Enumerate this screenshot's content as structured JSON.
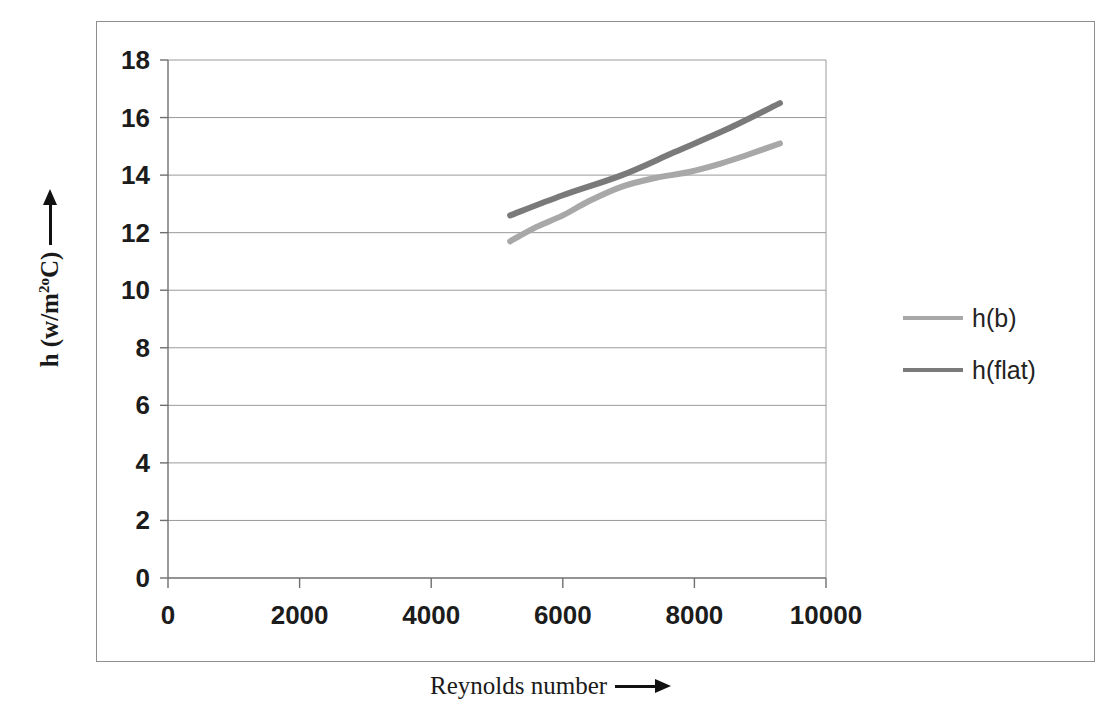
{
  "chart_data": {
    "type": "line",
    "title": "",
    "xlabel": "Reynolds number",
    "ylabel": "h (w/m2oC)",
    "ylabel_parts": {
      "prefix": "h  (w/m",
      "superscript": "2o",
      "suffix": "C)"
    },
    "xlim": [
      0,
      10000
    ],
    "ylim": [
      0,
      18
    ],
    "xticks": [
      0,
      2000,
      4000,
      6000,
      8000,
      10000
    ],
    "yticks": [
      0,
      2,
      4,
      6,
      8,
      10,
      12,
      14,
      16,
      18
    ],
    "xtick_labels": [
      "0",
      "2000",
      "4000",
      "6000",
      "8000",
      "10000"
    ],
    "ytick_labels": [
      "0",
      "2",
      "4",
      "6",
      "8",
      "10",
      "12",
      "14",
      "16",
      "18"
    ],
    "grid": "horizontal",
    "legend_position": "right",
    "series": [
      {
        "name": "h(b)",
        "color": "#a8a8a8",
        "x": [
          5200,
          5600,
          6000,
          6400,
          6900,
          7400,
          7900,
          8400,
          8800,
          9300
        ],
        "y": [
          11.7,
          12.2,
          12.6,
          13.1,
          13.6,
          13.9,
          14.1,
          14.4,
          14.7,
          15.1
        ]
      },
      {
        "name": "h(flat)",
        "color": "#7a7a7a",
        "x": [
          5200,
          6000,
          6900,
          7700,
          8500,
          9300
        ],
        "y": [
          12.6,
          13.3,
          14.0,
          14.8,
          15.6,
          16.5
        ]
      }
    ]
  },
  "legend": {
    "entries": [
      {
        "label": "h(b)",
        "color": "#a8a8a8"
      },
      {
        "label": "h(flat)",
        "color": "#7a7a7a"
      }
    ]
  },
  "axes": {
    "x_title": "Reynolds number",
    "y_title_prefix": "h  (w/m",
    "y_title_sup": "2o",
    "y_title_suffix": "C)"
  },
  "colors": {
    "frame": "#8d8d8d",
    "axis": "#6f6f6f",
    "gridline": "#9a9a9a",
    "text": "#1c1c1c",
    "series_light": "#a8a8a8",
    "series_dark": "#7a7a7a"
  }
}
